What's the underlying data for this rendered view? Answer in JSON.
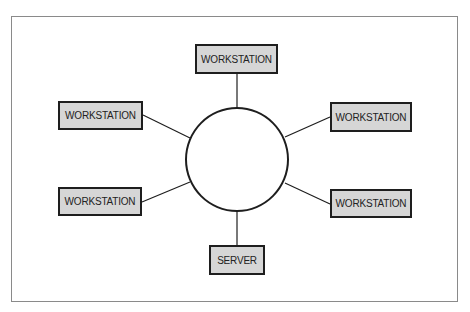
{
  "diagram": {
    "type": "star-ring network topology",
    "hub": {
      "label": ""
    },
    "nodes": [
      {
        "id": "top",
        "label": "WORKSTATION"
      },
      {
        "id": "upper-left",
        "label": "WORKSTATION"
      },
      {
        "id": "upper-right",
        "label": "WORKSTATION"
      },
      {
        "id": "lower-left",
        "label": "WORKSTATION"
      },
      {
        "id": "lower-right",
        "label": "WORKSTATION"
      },
      {
        "id": "bottom",
        "label": "SERVER"
      }
    ],
    "colors": {
      "box_fill": "#d6d6d6",
      "stroke": "#1e1e1e",
      "frame": "#8a8a8a"
    }
  }
}
